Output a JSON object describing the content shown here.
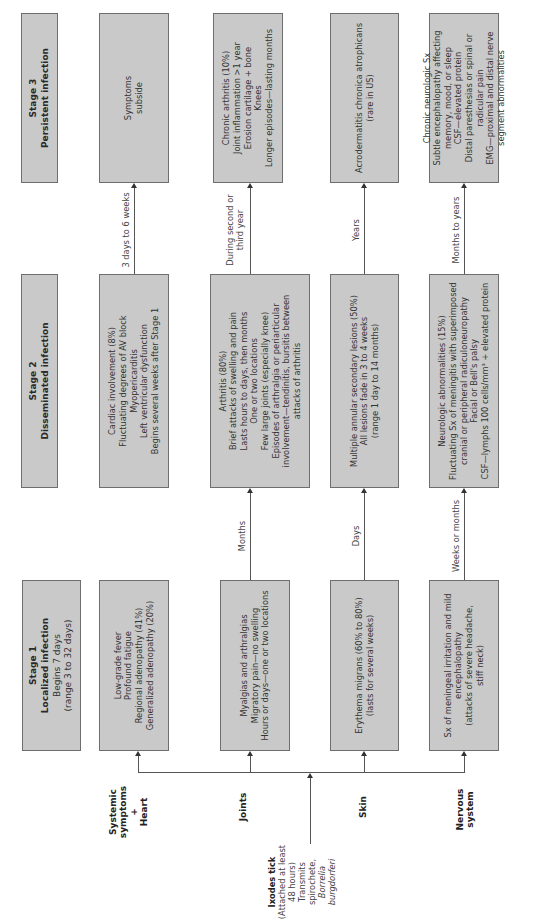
{
  "stages": [
    {
      "title": "Stage 1",
      "subtitle": "Localized infection",
      "lines": [
        "Begins 7 days",
        "(range 3 to 32 days)"
      ]
    },
    {
      "title": "Stage 2",
      "subtitle": "Disseminated infection",
      "lines": []
    },
    {
      "title": "Stage 3",
      "subtitle": "Persistent infection",
      "lines": []
    }
  ],
  "rows": [
    {
      "label_lines": [
        "Systemic",
        "symptoms",
        "+",
        "Heart"
      ]
    },
    {
      "label_lines": [
        "Joints"
      ]
    },
    {
      "label_lines": [
        "Skin"
      ]
    },
    {
      "label_lines": [
        "Nervous",
        "system"
      ]
    }
  ],
  "origin": {
    "title": "Ixodes tick",
    "lines": [
      "(Attached at least",
      "48 hours)",
      "Transmits",
      "spirochete,"
    ],
    "organism": "Borrelia burgdorferi"
  },
  "cells": {
    "systemic": {
      "stage1": [
        "Low-grade fever",
        "Profound fatigue",
        "Regional adenopathy (41%)",
        "Generalized adenopathy (20%)"
      ],
      "stage2": [
        "Cardiac involvement (8%)",
        "Fluctuating degrees of AV block",
        "Myopericarditis",
        "Left ventricular dysfunction",
        "Begins several weeks after Stage 1"
      ],
      "stage3": [
        "Symptoms",
        "subside"
      ]
    },
    "joints": {
      "stage1": [
        "Myalgias and arthralgias",
        "Migratory pain—no swelling",
        "Hours or days—one or two locations"
      ],
      "stage2": [
        "Arthritis (80%)",
        "Brief attacks of swelling and pain",
        "Lasts hours to days, then months",
        "One or two locations",
        "Few large joints (especially knee)",
        "Episodes of arthralgia or periarticular",
        "involvement—tendinitis, bursitis between",
        "attacks of arthritis"
      ],
      "stage3": [
        "Chronic arthritis (10%)",
        "Joint inflammation >1 year",
        "Erosion cartilage + bone",
        "Knees",
        "Longer episodes—lasting months"
      ]
    },
    "skin": {
      "stage1": [
        "Erythema migrans (60% to 80%)",
        "(lasts for several weeks)"
      ],
      "stage2": [
        "Multiple annular secondary lesions (50%)",
        "All lesions fade in 3 to 4 weeks",
        "(range 1 day to 14 months)"
      ],
      "stage3": [
        "Acrodermatitis chronica atrophicans",
        "(rare in US)"
      ]
    },
    "nervous": {
      "stage1": [
        "Sx of meningeal irritation and mild",
        "encephalopathy",
        "(attacks of severe headache,",
        "stiff neck)"
      ],
      "stage2": [
        "Neurologic abnormalities (15%)",
        "Fluctuating Sx of meningitis with superimposed",
        "cranial or peripheral radiculoneuropathy",
        "Facial or Bell's palsy",
        "CSF—lymphs 100 cells/mm³ + elevated protein"
      ],
      "stage3": [
        "Chronic neurologic Sx",
        "Subtle encephalopathy affecting",
        "memory, mood, or sleep",
        "CSF—elevated protein",
        "Distal paresthesias or spinal or",
        "radicular pain",
        "EMG—proximal and distal nerve",
        "segment abnormalities"
      ]
    }
  },
  "transitions": {
    "systemic": {
      "s1_to_s2": "",
      "s2_to_s3": "3 days to 6 weeks"
    },
    "joints": {
      "s1_to_s2": "Months",
      "s2_to_s3_lines": [
        "During second or",
        "third year"
      ]
    },
    "skin": {
      "s1_to_s2": "Days",
      "s2_to_s3": "Years"
    },
    "nervous": {
      "s1_to_s2": "Weeks or months",
      "s2_to_s3": "Months to years"
    }
  },
  "colors": {
    "box_fill": "#c9c9c9",
    "box_border": "#6e6e6e",
    "line": "#555555",
    "background": "#ffffff"
  }
}
